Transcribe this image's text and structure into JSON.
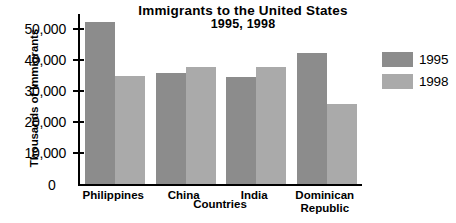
{
  "chart_data": {
    "type": "bar",
    "title": "Immigrants to the United States",
    "subtitle": "1995, 1998",
    "xlabel": "Countries",
    "ylabel": "Thousands of Immigrants",
    "categories": [
      "Philippines",
      "China",
      "India",
      "Dominican\nRepublic"
    ],
    "series": [
      {
        "name": "1995",
        "color": "#8c8c8c",
        "values": [
          52500,
          36000,
          34500,
          42500
        ]
      },
      {
        "name": "1998",
        "color": "#aaaaaa",
        "values": [
          34800,
          38000,
          38000,
          26000
        ]
      }
    ],
    "ylim": [
      0,
      55000
    ],
    "yticks": [
      0,
      10000,
      20000,
      30000,
      40000,
      50000
    ],
    "ytick_labels": [
      "0",
      "10,000",
      "20,000",
      "30,000",
      "40,000",
      "50,000"
    ],
    "grid": false,
    "legend_position": "right"
  }
}
